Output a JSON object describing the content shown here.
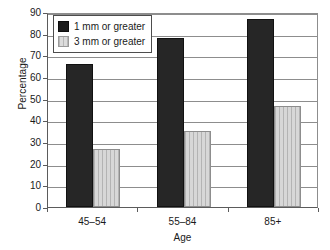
{
  "chart_data": {
    "type": "bar",
    "title": "",
    "subtitle": "",
    "xlabel": "Age",
    "ylabel": "Percentage",
    "categories": [
      "45–54",
      "55–84",
      "85+"
    ],
    "series": [
      {
        "name": "1 mm or greater",
        "color": "#262626",
        "values": [
          66,
          78,
          87
        ]
      },
      {
        "name": "3 mm or greater",
        "color": "#d7d7d7",
        "values": [
          27,
          35,
          46.5
        ]
      }
    ],
    "ylim": [
      0,
      90
    ],
    "ytick_step": 10,
    "yticks": [
      0,
      10,
      20,
      30,
      40,
      50,
      60,
      70,
      80,
      90
    ],
    "ytick_labels": [
      "0",
      "10",
      "20",
      "30",
      "40",
      "50",
      "60",
      "70",
      "80",
      "90"
    ],
    "grid": "horizontal",
    "legend_position": "upper-left-inside",
    "legend_entries": [
      "1 mm or greater",
      "3 mm or greater"
    ],
    "axis_color": "#5b5b5b",
    "grid_color": "#8d8d8d",
    "background": "#ffffff"
  }
}
